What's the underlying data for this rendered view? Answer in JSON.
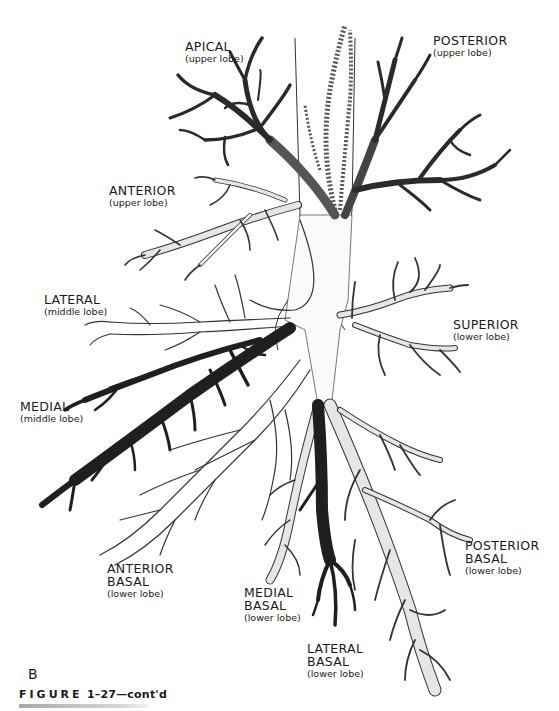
{
  "figure": {
    "panel_letter": "B",
    "caption_prefix": "FIGURE",
    "caption_rest": "1–27—cont'd"
  },
  "colors": {
    "dark_segment": "#2a2a2a",
    "mid_segment": "#6e6e6e",
    "light_segment": "#e6e6e6",
    "outline": "#333333",
    "text": "#1a1a1a"
  },
  "labels": [
    {
      "id": "apical",
      "title": "APICAL",
      "lobe": "(upper lobe)",
      "shade": "dark"
    },
    {
      "id": "posterior",
      "title": "POSTERIOR",
      "lobe": "(upper lobe)",
      "shade": "dark"
    },
    {
      "id": "anterior",
      "title": "ANTERIOR",
      "lobe": "(upper lobe)",
      "shade": "light"
    },
    {
      "id": "lateral-middle",
      "title": "LATERAL",
      "lobe": "(middle lobe)",
      "shade": "outline"
    },
    {
      "id": "superior",
      "title": "SUPERIOR",
      "lobe": "(lower lobe)",
      "shade": "light"
    },
    {
      "id": "medial-middle",
      "title": "MEDIAL",
      "lobe": "(middle lobe)",
      "shade": "dark"
    },
    {
      "id": "anterior-basal",
      "title": "ANTERIOR",
      "title2": "BASAL",
      "lobe": "(lower lobe)",
      "shade": "outline"
    },
    {
      "id": "medial-basal",
      "title": "MEDIAL",
      "title2": "BASAL",
      "lobe": "(lower lobe)",
      "shade": "light"
    },
    {
      "id": "lateral-basal",
      "title": "LATERAL",
      "title2": "BASAL",
      "lobe": "(lower lobe)",
      "shade": "dark"
    },
    {
      "id": "posterior-basal",
      "title": "POSTERIOR",
      "title2": "BASAL",
      "lobe": "(lower lobe)",
      "shade": "light"
    }
  ]
}
